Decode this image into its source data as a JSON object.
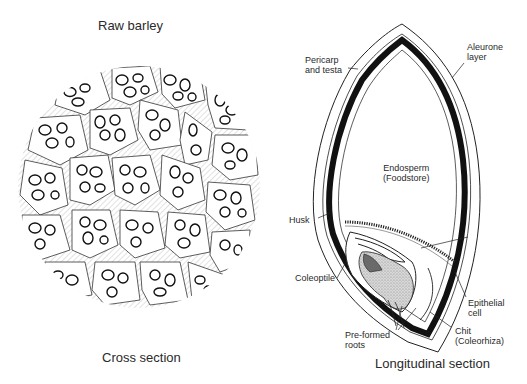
{
  "left_panel": {
    "title": "Raw barley",
    "caption": "Cross section"
  },
  "right_panel": {
    "caption": "Longitudinal section",
    "labels": {
      "pericarp": "Pericarp\nand testa",
      "aleurone": "Aleurone\nlayer",
      "endosperm": "Endosperm\n(Foodstore)",
      "husk": "Husk",
      "coleoptile": "Coleoptile",
      "epithelial": "Epithelial\ncell",
      "chit": "Chit\n(Coleorhiza)",
      "roots": "Pre-formed\nroots"
    }
  },
  "colors": {
    "ink": "#1a1a1a",
    "background": "#ffffff",
    "stipple": "#bdbdbd"
  }
}
